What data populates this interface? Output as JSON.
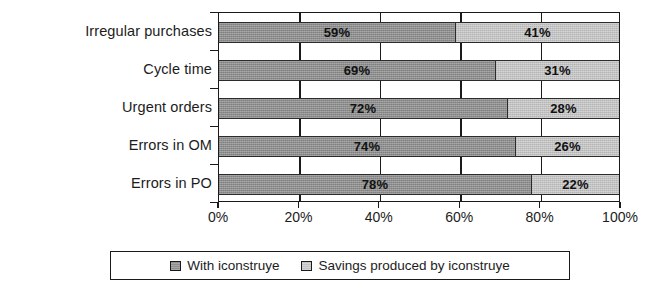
{
  "chart_data": {
    "type": "bar",
    "subtype": "horizontal-stacked-100-percent",
    "title": "",
    "subtitle": "",
    "xlabel": "",
    "ylabel": "",
    "categories": [
      "Irregular purchases",
      "Cycle  time",
      "Urgent  orders",
      "Errors in OM",
      "Errors in PO"
    ],
    "series": [
      {
        "name": "With iconstruye",
        "color": "#8e8e8e",
        "values": [
          59,
          69,
          72,
          74,
          78
        ],
        "value_labels": [
          "59%",
          "69%",
          "72%",
          "74%",
          "78%"
        ]
      },
      {
        "name": "Savings produced by iconstruye",
        "color": "#c2c2c2",
        "values": [
          41,
          31,
          28,
          26,
          22
        ],
        "value_labels": [
          "41%",
          "31%",
          "28%",
          "26%",
          "22%"
        ]
      }
    ],
    "xlim": [
      0,
      100
    ],
    "xticks": [
      0,
      20,
      40,
      60,
      80,
      100
    ],
    "xtick_labels": [
      "0%",
      "20%",
      "40%",
      "60%",
      "80%",
      "100%"
    ],
    "grid": true,
    "grid_axis": "x",
    "legend_position": "bottom",
    "legend_entries": [
      "With iconstruye",
      "Savings produced by iconstruye"
    ]
  },
  "colors": {
    "series_dark": "#8e8e8e",
    "series_light": "#c2c2c2",
    "axis": "#1a1a1a",
    "text": "#1c1c1c",
    "background": "#ffffff"
  }
}
